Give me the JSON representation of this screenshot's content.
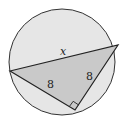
{
  "diagram": {
    "type": "geometry",
    "circle": {
      "cx": 62,
      "cy": 62,
      "r": 53,
      "fill": "#e6e6e6",
      "stroke": "#333333"
    },
    "triangle": {
      "vertices": [
        [
          10,
          71
        ],
        [
          118,
          45
        ],
        [
          75,
          110
        ]
      ],
      "fill": "#c9c9c9",
      "stroke": "#222222",
      "right_angle_vertex": 2
    },
    "labels": {
      "hypotenuse": "x",
      "left_leg": "8",
      "right_leg": "8"
    },
    "colors": {
      "circle_fill": "#e6e6e6",
      "triangle_fill": "#c9c9c9",
      "stroke": "#222222"
    }
  }
}
